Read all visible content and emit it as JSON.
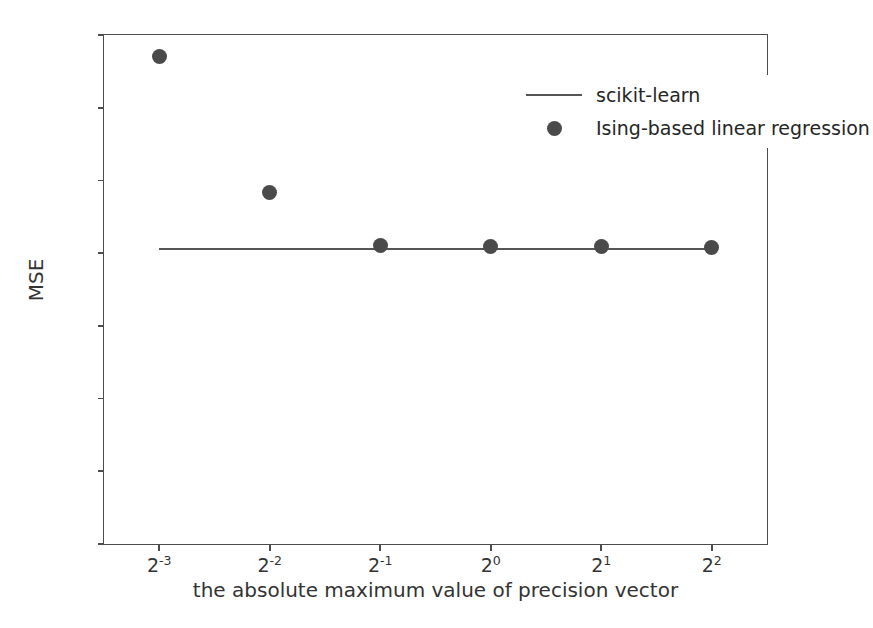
{
  "chart_data": {
    "type": "scatter",
    "title": "",
    "xlabel": "the absolute maximum value of precision vector",
    "ylabel": "MSE",
    "xlim": [
      -3.5,
      2.5
    ],
    "ylim": [
      0.0,
      0.7
    ],
    "grid": false,
    "legend_position": "upper right",
    "x_tick_labels": [
      "2⁻³",
      "2⁻²",
      "2⁻¹",
      "2⁰",
      "2¹",
      "2²"
    ],
    "x_tick_bases": [
      "2",
      "2",
      "2",
      "2",
      "2",
      "2"
    ],
    "x_tick_exponents": [
      "-3",
      "-2",
      "-1",
      "0",
      "1",
      "2"
    ],
    "x_tick_values": [
      0.125,
      0.25,
      0.5,
      1,
      2,
      4
    ],
    "y_tick_labels": [
      "0.0",
      "0.1",
      "0.2",
      "0.3",
      "0.4",
      "0.5",
      "0.6",
      "0.7"
    ],
    "y_tick_values": [
      0.0,
      0.1,
      0.2,
      0.3,
      0.4,
      0.5,
      0.6,
      0.7
    ],
    "series": [
      {
        "name": "scikit-learn",
        "kind": "line",
        "color": "#555555",
        "constant_value": 0.406,
        "x": [
          0.125,
          0.25,
          0.5,
          1,
          2,
          4
        ],
        "values": [
          0.406,
          0.406,
          0.406,
          0.406,
          0.406,
          0.406
        ]
      },
      {
        "name": "Ising-based linear regression",
        "kind": "scatter",
        "color": "#4a4a4a",
        "x": [
          0.125,
          0.25,
          0.5,
          1,
          2,
          4
        ],
        "values": [
          0.671,
          0.483,
          0.41,
          0.409,
          0.409,
          0.408
        ]
      }
    ]
  },
  "legend": {
    "entries": [
      {
        "label": "scikit-learn",
        "handle": "line"
      },
      {
        "label": "Ising-based linear regression",
        "handle": "marker"
      }
    ]
  }
}
